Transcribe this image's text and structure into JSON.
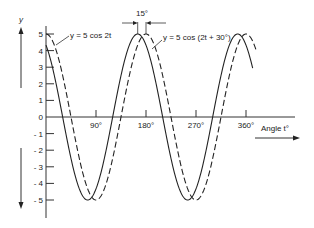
{
  "chart_data": {
    "type": "line",
    "title": "",
    "xlabel": "Angle t°",
    "ylabel": "y",
    "x_unit": "degrees",
    "xlim": [
      0,
      380
    ],
    "ylim": [
      -5,
      5
    ],
    "x_ticks": [
      {
        "value": 90,
        "label": "90°"
      },
      {
        "value": 180,
        "label": "180°"
      },
      {
        "value": 270,
        "label": "270°"
      },
      {
        "value": 360,
        "label": "360°"
      }
    ],
    "y_ticks": [
      {
        "value": 5,
        "label": "5"
      },
      {
        "value": 4,
        "label": "4"
      },
      {
        "value": 3,
        "label": "3"
      },
      {
        "value": 2,
        "label": "2"
      },
      {
        "value": 1,
        "label": "1"
      },
      {
        "value": 0,
        "label": "0"
      },
      {
        "value": -1,
        "label": "- 1"
      },
      {
        "value": -2,
        "label": "- 2"
      },
      {
        "value": -3,
        "label": "- 3"
      },
      {
        "value": -4,
        "label": "- 4"
      },
      {
        "value": -5,
        "label": "- 5"
      }
    ],
    "grid": false,
    "series": [
      {
        "name": "y = 5 cos (2t + 30°)",
        "style": "solid",
        "amplitude": 5,
        "frequency": 2,
        "phase_deg": 30,
        "x": [
          0,
          15,
          30,
          45,
          60,
          75,
          90,
          105,
          120,
          135,
          150,
          165,
          180,
          195,
          210,
          225,
          240,
          255,
          270,
          285,
          300,
          315,
          330,
          345,
          360,
          375
        ],
        "values": [
          4.33,
          2.5,
          0,
          -2.5,
          -4.33,
          -5,
          -4.33,
          -2.5,
          0,
          2.5,
          4.33,
          5,
          4.33,
          2.5,
          0,
          -2.5,
          -4.33,
          -5,
          -4.33,
          -2.5,
          0,
          2.5,
          4.33,
          5,
          4.33,
          2.5
        ]
      },
      {
        "name": "y = 5 cos 2t",
        "style": "dashed",
        "amplitude": 5,
        "frequency": 2,
        "phase_deg": 0,
        "x": [
          0,
          15,
          30,
          45,
          60,
          75,
          90,
          105,
          120,
          135,
          150,
          165,
          180,
          195,
          210,
          225,
          240,
          255,
          270,
          285,
          300,
          315,
          330,
          345,
          360,
          375
        ],
        "values": [
          5,
          4.33,
          2.5,
          0,
          -2.5,
          -4.33,
          -5,
          -4.33,
          -2.5,
          0,
          2.5,
          4.33,
          5,
          4.33,
          2.5,
          0,
          -2.5,
          -4.33,
          -5,
          -4.33,
          -2.5,
          0,
          2.5,
          4.33,
          5,
          4.33
        ]
      }
    ],
    "annotations": [
      {
        "text": "y = 5 cos 2t",
        "target_series": "dashed"
      },
      {
        "text": "y = 5 cos (2t + 30°)",
        "target_series": "solid"
      },
      {
        "text": "15°",
        "meaning": "horizontal phase shift between peaks near 180°"
      }
    ]
  },
  "labels": {
    "y_axis": "y",
    "x_axis": "Angle t°",
    "curve_dashed": "y = 5 cos 2t",
    "curve_solid": "y = 5 cos (2t + 30°)",
    "phase_shift": "15°",
    "tick_90": "90°",
    "tick_180": "180°",
    "tick_270": "270°",
    "tick_360": "360°",
    "y5": "5",
    "y4": "4",
    "y3": "3",
    "y2": "2",
    "y1": "1",
    "y0": "0",
    "yn1": "- 1",
    "yn2": "- 2",
    "yn3": "- 3",
    "yn4": "- 4",
    "yn5": "- 5"
  }
}
